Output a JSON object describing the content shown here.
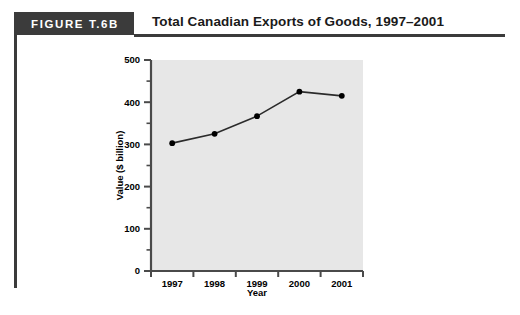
{
  "figure": {
    "badge_label": "FIGURE T.6B",
    "title": "Total Canadian Exports of Goods, 1997–2001",
    "badge_color": "#3b3b3b",
    "rule_color": "#3b3b3b"
  },
  "chart_data": {
    "type": "line",
    "title": "Total Canadian Exports of Goods, 1997–2001",
    "xlabel": "Year",
    "ylabel": "Value ($ billion)",
    "categories": [
      "1997",
      "1998",
      "1999",
      "2000",
      "2001"
    ],
    "values": [
      303,
      325,
      367,
      425,
      415
    ],
    "series": [
      {
        "name": "Total Canadian Exports of Goods",
        "values": [
          303,
          325,
          367,
          425,
          415
        ]
      }
    ],
    "ylim": [
      0,
      500
    ],
    "yticks": [
      0,
      100,
      200,
      300,
      400,
      500
    ],
    "ytick_labels": [
      "0",
      "100",
      "200",
      "300",
      "400",
      "500"
    ],
    "y_minor_tick_step": 50,
    "xtick_labels": [
      "1997",
      "1998",
      "1999",
      "2000",
      "2001"
    ],
    "grid": false,
    "legend": "none",
    "plot_background": "#e7e7e7",
    "line_color": "#2b2b2b",
    "marker_color": "#000000",
    "marker": "circle",
    "axis_color": "#4a4a4a"
  }
}
